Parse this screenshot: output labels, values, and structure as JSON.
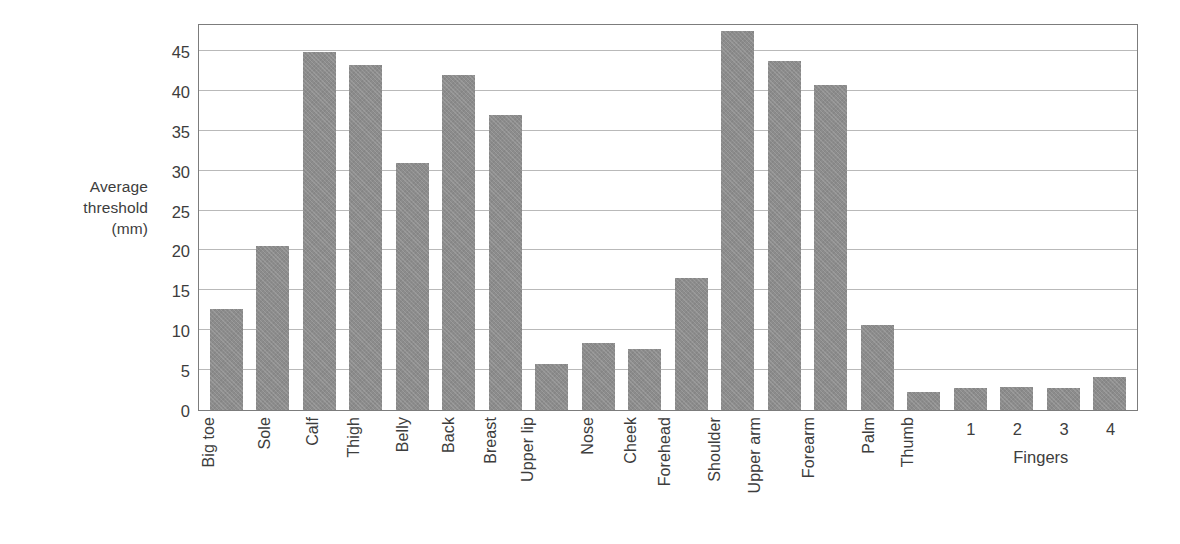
{
  "chart_data": {
    "type": "bar",
    "title": "",
    "xlabel": "",
    "ylabel": "Average threshold (mm)",
    "ylim": [
      0,
      48.5
    ],
    "yticks": [
      0,
      5,
      10,
      15,
      20,
      25,
      30,
      35,
      40,
      45
    ],
    "ytick_labels": [
      "0",
      "5",
      "10",
      "15",
      "20",
      "25",
      "30",
      "35",
      "40",
      "45"
    ],
    "grid": true,
    "legend": null,
    "bar_color": "#8c8c8c",
    "frame_color": "#7c7c7c",
    "gridline_color": "#b9b9b9",
    "categories": [
      "Big toe",
      "Sole",
      "Calf",
      "Thigh",
      "Belly",
      "Back",
      "Breast",
      "Upper lip",
      "Nose",
      "Cheek",
      "Forehead",
      "Shoulder",
      "Upper arm",
      "Forearm",
      "Palm",
      "Thumb",
      "1",
      "2",
      "3",
      "4"
    ],
    "values": [
      12.7,
      20.5,
      44.9,
      43.3,
      31.0,
      42.0,
      37.0,
      5.8,
      8.4,
      7.6,
      16.5,
      47.5,
      43.7,
      40.7,
      10.6,
      2.3,
      2.7,
      2.9,
      2.8,
      4.2
    ],
    "label_rotation": [
      "vertical",
      "vertical",
      "vertical",
      "vertical",
      "vertical",
      "vertical",
      "vertical",
      "vertical",
      "vertical",
      "vertical",
      "vertical",
      "vertical",
      "vertical",
      "vertical",
      "vertical",
      "vertical",
      "horizontal",
      "horizontal",
      "horizontal",
      "horizontal"
    ],
    "group_labels": [
      {
        "text": "Fingers",
        "covers": [
          "1",
          "2",
          "3",
          "4"
        ]
      }
    ]
  },
  "axis_title_lines": [
    "Average",
    "threshold",
    "(mm)"
  ]
}
